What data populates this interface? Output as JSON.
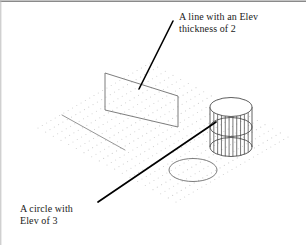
{
  "figure": {
    "background_color": "#ffffff",
    "frame_color": "#8a8a8a"
  },
  "annotations": {
    "thickness_label": {
      "name": "a-line-with-an-elev-thickness-of-2",
      "line1": "A line with an Elev",
      "line2": "thickness of 2",
      "color": "#1a1a1a"
    },
    "circle_label": {
      "name": "a-circle-with-elev-of-3",
      "line1": "A circle with",
      "line2": "Elev of 3",
      "color": "#1a1a1a"
    }
  },
  "leaders": {
    "thickness_leader": {
      "name": "leader-to-extruded-plane",
      "x1": 173,
      "y1": 21,
      "x2": 139,
      "y2": 89,
      "color": "#000000",
      "width": 1.6
    },
    "circle_leader": {
      "name": "leader-to-cylinder",
      "x1": 98,
      "y1": 202,
      "x2": 216,
      "y2": 122,
      "color": "#000000",
      "width": 1.7
    }
  },
  "geometry": {
    "grid": {
      "name": "isometric-dot-grid",
      "dot_color": "#cfcfcf",
      "dot_radius": 0.55,
      "corners": {
        "left": {
          "x": 38,
          "y": 128
        },
        "top": {
          "x": 150,
          "y": 63
        },
        "right": {
          "x": 290,
          "y": 139
        },
        "bottom": {
          "x": 176,
          "y": 202
        }
      },
      "columns": 26,
      "rows": 18
    },
    "extruded_plane": {
      "name": "extruded-line-plane",
      "stroke": "#6e6e6e",
      "stroke_width": 0.9,
      "points": "105,73 178,96 178,127 105,110"
    },
    "flat_line": {
      "name": "flat-line-on-grid",
      "stroke": "#8a8a8a",
      "stroke_width": 0.9,
      "x1": 62,
      "y1": 115,
      "x2": 125,
      "y2": 150
    },
    "flat_circle": {
      "name": "flat-circle-on-grid",
      "stroke": "#6e6e6e",
      "stroke_width": 0.9,
      "cx": 193,
      "cy": 170,
      "rx": 24,
      "ry": 11.5
    },
    "cylinder": {
      "name": "extruded-circle-cylinder",
      "stroke": "#3a3a3a",
      "stroke_width": 0.8,
      "cx": 231,
      "top_y": 107,
      "mid_y": 127,
      "bottom_y": 147,
      "rx": 21,
      "ry": 9.5,
      "generators": 11
    }
  }
}
